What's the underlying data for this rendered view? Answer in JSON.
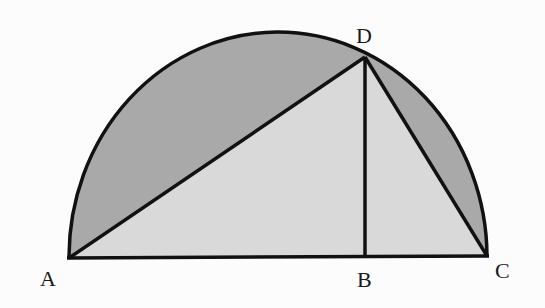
{
  "diagram": {
    "type": "semicircle with inscribed triangle and altitude",
    "colors": {
      "background": "#fcfcfc",
      "segment_fill": "#a9a9a9",
      "triangle_fill": "#d9d9d9",
      "stroke": "#111111"
    },
    "points": {
      "A": {
        "label": "A",
        "x": 69,
        "y": 258
      },
      "B": {
        "label": "B",
        "x": 365,
        "y": 257
      },
      "C": {
        "label": "C",
        "x": 487,
        "y": 256
      },
      "D": {
        "label": "D",
        "x": 365,
        "y": 57
      }
    },
    "segments": [
      "AC",
      "AD",
      "DC",
      "DB"
    ],
    "shaded_regions": [
      "segment between chord AD and arc",
      "segment between chord DC and arc"
    ],
    "unshaded_regions": [
      "triangle ADC"
    ]
  }
}
